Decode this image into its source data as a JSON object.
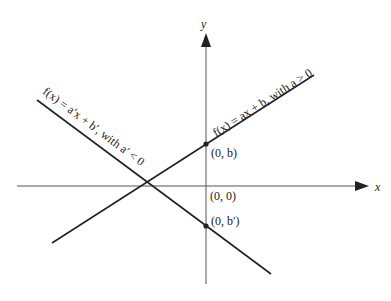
{
  "diagram": {
    "type": "linear-functions-graph",
    "axes": {
      "x_label": "x",
      "y_label": "y",
      "origin_label": "(0, 0)"
    },
    "lines": [
      {
        "id": "line-positive-slope",
        "label": "f(x) = ax + b, with a > 0",
        "intercept_label": "(0, b)",
        "slope_sign": "positive"
      },
      {
        "id": "line-negative-slope",
        "label": "f(x) = a′x + b′, with a′ < 0",
        "intercept_label": "(0, b′)",
        "slope_sign": "negative"
      }
    ],
    "colors": {
      "axis": "#555555",
      "line": "#222222",
      "background": "#ffffff"
    }
  }
}
